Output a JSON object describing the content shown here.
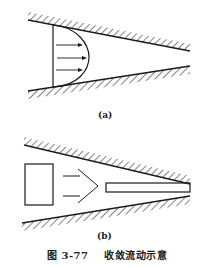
{
  "figure": {
    "panel_a": {
      "label": "(a)",
      "description": "Converging channel with velocity profile",
      "arrows_count": 3
    },
    "panel_b": {
      "label": "(b)",
      "description": "Converging channel with block, chevron arrow and thin plate"
    },
    "caption": {
      "number": "图 3-77",
      "title": "收敛流动示意"
    }
  },
  "colors": {
    "line": "#1a1a1a",
    "background": "#ffffff"
  }
}
